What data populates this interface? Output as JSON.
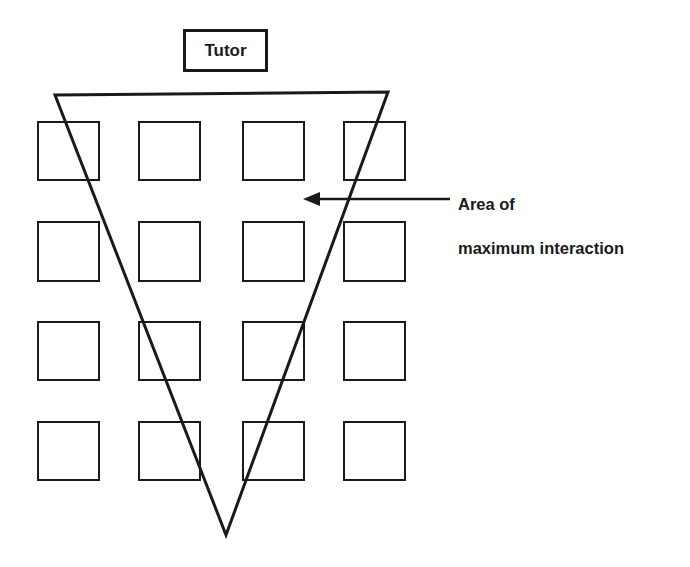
{
  "diagram": {
    "title_box": {
      "label": "Tutor",
      "x": 183,
      "y": 29,
      "w": 85,
      "h": 43
    },
    "annotation": {
      "line1": "Area of",
      "line2": "maximum interaction",
      "full_text": "Area of maximum interaction",
      "x": 458,
      "y": 172
    },
    "arrow": {
      "name": "annotation-arrow",
      "from_x": 450,
      "from_y": 199,
      "to_x": 305,
      "to_y": 199,
      "direction": "left"
    },
    "triangle": {
      "name": "area-of-maximum-interaction-triangle",
      "description": "inverted triangle fanning down from the tutor position",
      "points": "55,95 388,92 226,535",
      "apex_x": 226,
      "apex_y": 535
    },
    "grid": {
      "rows": 4,
      "cols": 4,
      "square_size": 61,
      "col_x": [
        38,
        139,
        243,
        344
      ],
      "row_y": [
        122,
        222,
        322,
        422
      ],
      "cells": [
        [
          "seat-r1c1",
          "seat-r1c2",
          "seat-r1c3",
          "seat-r1c4"
        ],
        [
          "seat-r2c1",
          "seat-r2c2",
          "seat-r2c3",
          "seat-r2c4"
        ],
        [
          "seat-r3c1",
          "seat-r3c2",
          "seat-r3c3",
          "seat-r3c4"
        ],
        [
          "seat-r4c1",
          "seat-r4c2",
          "seat-r4c3",
          "seat-r4c4"
        ]
      ]
    },
    "colors": {
      "ink": "#1a1a1a",
      "background": "#ffffff"
    }
  }
}
